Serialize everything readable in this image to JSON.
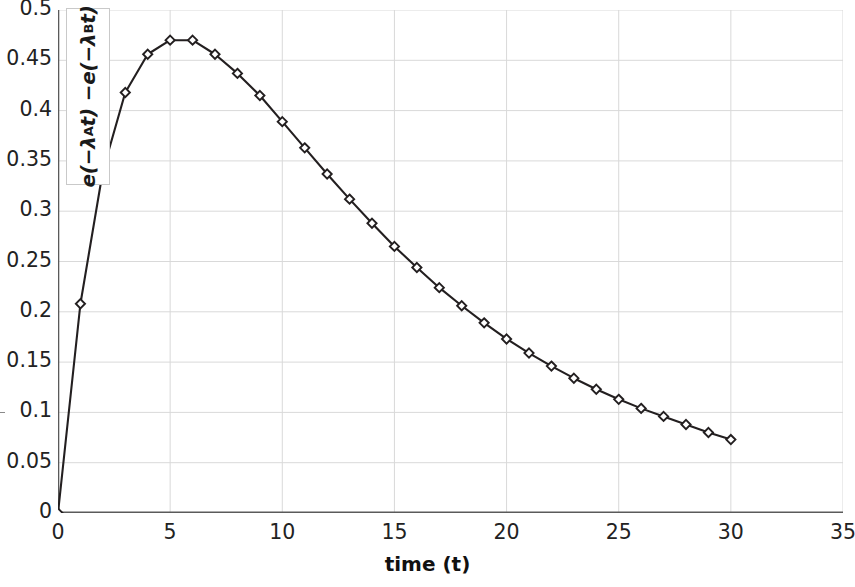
{
  "chart_data": {
    "type": "line",
    "title": "",
    "xlabel": "time (t)",
    "ylabel": "e(-λ_A t) - e(-λ_B t)",
    "ylabel_parts": {
      "prefix1": "e(−λ",
      "subA": "A",
      "mid": "t) −e(−λ",
      "subB": "B",
      "suffix": "t)"
    },
    "xlim": [
      0,
      35
    ],
    "ylim": [
      0,
      0.5
    ],
    "xticks": [
      0,
      5,
      10,
      15,
      20,
      25,
      30,
      35
    ],
    "xtick_labels": [
      "0",
      "5",
      "10",
      "15",
      "20",
      "25",
      "30",
      "35"
    ],
    "yticks": [
      0,
      0.05,
      0.1,
      0.15,
      0.2,
      0.25,
      0.3,
      0.35,
      0.4,
      0.45,
      0.5
    ],
    "ytick_labels": [
      "0",
      "0.05",
      "0.1",
      "0.15",
      "0.2",
      "0.25",
      "0.3",
      "0.35",
      "0.4",
      "0.45",
      "0.5"
    ],
    "grid": {
      "x": true,
      "y": true,
      "color": "#d9d9d9"
    },
    "legend": null,
    "marker": "diamond",
    "line_color": "#231f20",
    "marker_fill": "#ffffff",
    "marker_edge": "#231f20",
    "x": [
      0,
      1,
      2,
      3,
      4,
      5,
      6,
      7,
      8,
      9,
      10,
      11,
      12,
      13,
      14,
      15,
      16,
      17,
      18,
      19,
      20,
      21,
      22,
      23,
      24,
      25,
      26,
      27,
      28,
      29,
      30
    ],
    "values": [
      0.0,
      0.208,
      0.34,
      0.418,
      0.456,
      0.47,
      0.47,
      0.456,
      0.437,
      0.415,
      0.389,
      0.363,
      0.337,
      0.312,
      0.288,
      0.265,
      0.244,
      0.224,
      0.206,
      0.189,
      0.173,
      0.159,
      0.146,
      0.134,
      0.123,
      0.113,
      0.104,
      0.096,
      0.088,
      0.08,
      0.073
    ]
  }
}
